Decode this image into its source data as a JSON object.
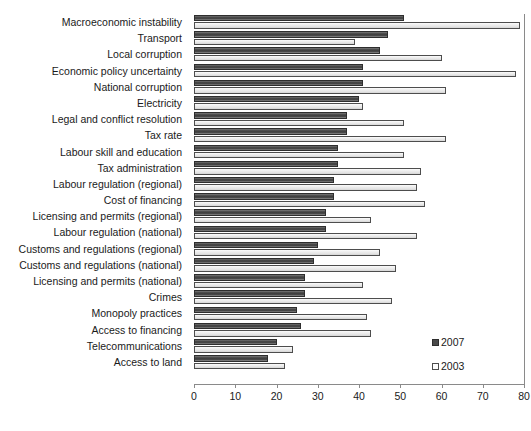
{
  "chart_data": {
    "type": "bar",
    "orientation": "horizontal",
    "title": "",
    "xlabel": "",
    "ylabel": "",
    "xlim": [
      0,
      80
    ],
    "xticks": [
      0,
      10,
      20,
      30,
      40,
      50,
      60,
      70,
      80
    ],
    "grid": false,
    "legend_position": "inside-right-lower",
    "categories": [
      "Macroeconomic instability",
      "Transport",
      "Local corruption",
      "Economic policy uncertainty",
      "National corruption",
      "Electricity",
      "Legal and conflict resolution",
      "Tax rate",
      "Labour skill and education",
      "Tax administration",
      "Labour regulation (regional)",
      "Cost of financing",
      "Licensing and permits (regional)",
      "Labour regulation (national)",
      "Customs and regulations (regional)",
      "Customs and regulations (national)",
      "Licensing and permits (national)",
      "Crimes",
      "Monopoly practices",
      "Access to financing",
      "Telecommunications",
      "Access to land"
    ],
    "series": [
      {
        "name": "2007",
        "color": "#4a4a4a",
        "values": [
          51,
          47,
          45,
          41,
          41,
          40,
          37,
          37,
          35,
          35,
          34,
          34,
          32,
          32,
          30,
          29,
          27,
          27,
          25,
          26,
          20,
          18
        ]
      },
      {
        "name": "2003",
        "color": "#ededed",
        "values": [
          79,
          39,
          60,
          78,
          61,
          41,
          51,
          61,
          51,
          55,
          54,
          56,
          43,
          54,
          45,
          49,
          41,
          48,
          42,
          43,
          24,
          22
        ]
      }
    ]
  },
  "legend": {
    "items": [
      {
        "label": "2007",
        "swatch": "filled-dark-square"
      },
      {
        "label": "2003",
        "swatch": "open-white-square"
      }
    ]
  },
  "axis": {
    "tick_labels": [
      "0",
      "10",
      "20",
      "30",
      "40",
      "50",
      "60",
      "70",
      "80"
    ]
  }
}
